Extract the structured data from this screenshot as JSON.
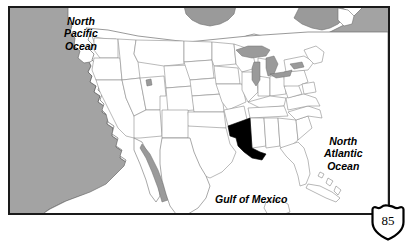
{
  "page": {
    "background_color": "#ffffff",
    "width": 411,
    "height": 248
  },
  "map": {
    "name": "united-states-outline-map",
    "frame": {
      "border_color": "#1a1a1a",
      "border_width": 2,
      "x": 8,
      "y": 6,
      "width": 382,
      "height": 209
    },
    "colors": {
      "ocean": "#a3a3a3",
      "land": "#ffffff",
      "lakes": "#9a9a9a",
      "state_border": "#8c8c8c",
      "country_border": "#4a4a4a",
      "highlight": "#000000",
      "frame": "#1a1a1a"
    },
    "labels": [
      {
        "id": "north-pacific-ocean",
        "text": "North\nPacific\nOcean",
        "style": "bold-italic",
        "region": "ocean"
      },
      {
        "id": "north-atlantic-ocean",
        "text": "North\nAtlantic\nOcean",
        "style": "bold-italic",
        "region": "ocean"
      },
      {
        "id": "gulf-of-mexico",
        "text": "Gulf of Mexico",
        "style": "bold-italic",
        "region": "gulf"
      }
    ],
    "highlighted_state": {
      "name": "Louisiana",
      "fill": "#000000"
    }
  },
  "shield": {
    "name": "interstate-shield",
    "number": "85",
    "fill": "#ffffff",
    "outline": "#000000",
    "text_color": "#000000"
  }
}
